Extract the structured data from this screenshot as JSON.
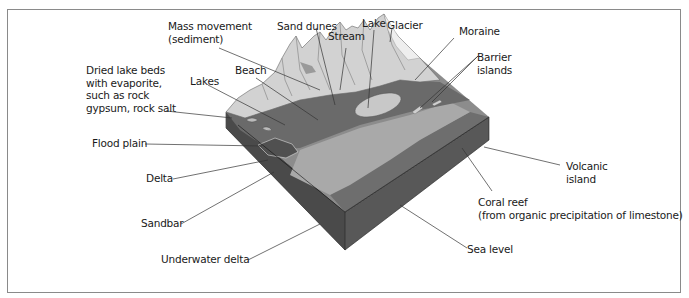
{
  "figure": {
    "title": "",
    "colors": {
      "background": "#ffffff",
      "frame_border": "#8a8a8a",
      "mountain_light": "#d4d4d4",
      "mountain_mid": "#bdbdbd",
      "lowland_dark": "#6f6f6f",
      "shallow_water": "#a8a8a8",
      "deep_water": "#7a7a7a",
      "block_side_left": "#4a4a4a",
      "block_side_right": "#5a5a5a",
      "label_text": "#1a1a1a",
      "leader_line": "#333333"
    }
  },
  "labels": [
    {
      "id": "mass-movement",
      "text": "Mass movement\n(sediment)"
    },
    {
      "id": "sand-dunes",
      "text": "Sand dunes"
    },
    {
      "id": "stream",
      "text": "Stream"
    },
    {
      "id": "lake",
      "text": "Lake"
    },
    {
      "id": "glacier",
      "text": "Glacier"
    },
    {
      "id": "moraine",
      "text": "Moraine"
    },
    {
      "id": "barrier-islands",
      "text": "Barrier\nislands"
    },
    {
      "id": "dried-lake-beds",
      "text": "Dried lake beds\nwith evaporite,\nsuch as rock\ngypsum, rock salt"
    },
    {
      "id": "lakes",
      "text": "Lakes"
    },
    {
      "id": "beach",
      "text": "Beach"
    },
    {
      "id": "flood-plain",
      "text": "Flood plain"
    },
    {
      "id": "delta",
      "text": "Delta"
    },
    {
      "id": "sandbar",
      "text": "Sandbar"
    },
    {
      "id": "underwater-delta",
      "text": "Underwater delta"
    },
    {
      "id": "volcanic-island",
      "text": "Volcanic\nisland"
    },
    {
      "id": "coral-reef",
      "text": "Coral reef\n(from organic precipitation of limestone)"
    },
    {
      "id": "sea-level",
      "text": "Sea level"
    }
  ]
}
